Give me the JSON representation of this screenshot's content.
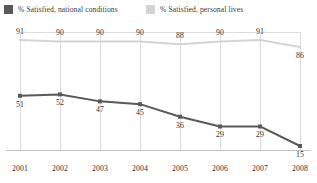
{
  "chart_data": {
    "type": "line",
    "title": "",
    "subtitle": "",
    "xlabel": "",
    "ylabel": "",
    "categories": [
      "2001",
      "2002",
      "2003",
      "2004",
      "2005",
      "2006",
      "2007",
      "2008"
    ],
    "ylim": [
      0,
      100
    ],
    "grid": "vertical",
    "legend_position": "top",
    "series": [
      {
        "name": "% Satisfied, national conditions",
        "color": "#58595b",
        "values": [
          51,
          52,
          47,
          45,
          36,
          29,
          29,
          15
        ],
        "labels": [
          "51",
          "52",
          "47",
          "45",
          "36",
          "29",
          "29",
          "15"
        ],
        "label_positions": [
          "below",
          "below",
          "below",
          "below",
          "below",
          "below",
          "below",
          "below"
        ],
        "markers": true
      },
      {
        "name": "% Satisfied, personal lives",
        "color": "#d2d3d4",
        "values": [
          91,
          90,
          90,
          90,
          88,
          90,
          91,
          86
        ],
        "labels": [
          "91",
          "90",
          "90",
          "90",
          "88",
          "90",
          "91",
          "86"
        ],
        "label_positions": [
          "above",
          "above",
          "above",
          "above",
          "above",
          "above",
          "above",
          "below"
        ],
        "markers": false
      }
    ]
  },
  "legend": {
    "items": [
      {
        "label": "% Satisfied, national conditions",
        "swatch_color": "#58595b"
      },
      {
        "label": "% Satisfied, personal lives",
        "swatch_color": "#d2d3d4"
      }
    ]
  },
  "axis": {
    "x_ticks": [
      "2001",
      "2002",
      "2003",
      "2004",
      "2005",
      "2006",
      "2007",
      "2008"
    ]
  },
  "colors": {
    "background": "#ffffff",
    "gridline": "#dcdcdc",
    "axisline": "#bfbfbf",
    "text": "#2f2f2f",
    "series_dark": "#58595b",
    "series_light": "#d2d3d4"
  }
}
